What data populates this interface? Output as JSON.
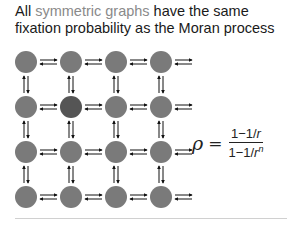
{
  "title": {
    "prefix": "All ",
    "highlight": "symmetric graphs",
    "suffix": " have the same fixation probability as the Moran process"
  },
  "colors": {
    "node": "#7a7a7a",
    "node_highlight": "#555555",
    "highlight_text": "#8a8a8a",
    "arrow": "#111111"
  },
  "graph": {
    "rows": 4,
    "cols": 4,
    "highlighted_node": [
      1,
      1
    ],
    "edges": "bidirectional lattice"
  },
  "formula": {
    "lhs": "ρ",
    "equals": "=",
    "numerator_prefix": "1−1/",
    "numerator_var": "r",
    "denominator_prefix": "1−1/",
    "denominator_var": "r",
    "denominator_exp": "n"
  }
}
